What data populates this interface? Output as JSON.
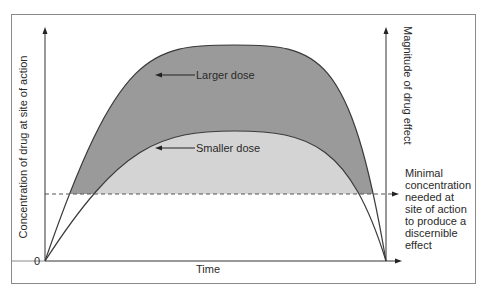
{
  "figure": {
    "left_axis_label": "Concentration of drug at site of action",
    "right_axis_label": "Magnitude of drug effect",
    "x_axis_label": "Time",
    "origin_label": "0",
    "curves": [
      {
        "name": "Larger dose",
        "label": "Larger dose",
        "fill": "#9a9a9a"
      },
      {
        "name": "Smaller dose",
        "label": "Smaller dose",
        "fill": "#d4d4d4"
      }
    ],
    "threshold": {
      "label_lines": [
        "Minimal",
        "concentration",
        "needed at",
        "site of action",
        "to produce a",
        "discernible",
        "effect"
      ]
    },
    "colors": {
      "frame": "#8a8a8a",
      "axis": "#333333",
      "curve_line": "#3a3a3a",
      "larger_fill": "#9a9a9a",
      "smaller_fill": "#d4d4d4",
      "threshold_line": "#555555"
    }
  }
}
